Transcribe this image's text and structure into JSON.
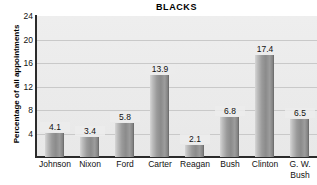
{
  "chart_data": {
    "type": "bar",
    "title": "BLACKS",
    "xlabel": "",
    "ylabel": "Percentage of all appointments",
    "categories": [
      "Johnson",
      "Nixon",
      "Ford",
      "Carter",
      "Reagan",
      "Bush",
      "Clinton",
      "G. W. Bush"
    ],
    "category_lines": [
      [
        "Johnson"
      ],
      [
        "Nixon"
      ],
      [
        "Ford"
      ],
      [
        "Carter"
      ],
      [
        "Reagan"
      ],
      [
        "Bush"
      ],
      [
        "Clinton"
      ],
      [
        "G. W.",
        "Bush"
      ]
    ],
    "values": [
      4.1,
      3.4,
      5.8,
      13.9,
      2.1,
      6.8,
      17.4,
      6.5
    ],
    "value_labels": [
      "4.1",
      "3.4",
      "5.8",
      "13.9",
      "2.1",
      "6.8",
      "17.4",
      "6.5"
    ],
    "ylim": [
      0,
      24
    ],
    "yticks": [
      24,
      20,
      16,
      12,
      8,
      4
    ],
    "ytick_labels": [
      "24",
      "20",
      "16",
      "12",
      "8",
      "4"
    ],
    "grid": true,
    "grid_y": [
      20,
      16,
      12,
      8,
      4
    ],
    "legend": null,
    "colors": {
      "plot_background": "#ececec",
      "bar_fill": "#8b8b8b",
      "bar_highlight": "#d6d6d6",
      "gridline": "#c9c9c9",
      "axis": "#2b2b2b",
      "text": "#111111",
      "page_background": "#ffffff"
    }
  }
}
